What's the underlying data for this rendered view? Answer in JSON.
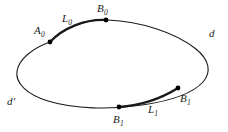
{
  "figure": {
    "type": "geometry-diagram",
    "stroke_color": "#1a1a1a",
    "background_color": "#ffffff",
    "point_color": "#000000"
  },
  "curve": {
    "name": "oval",
    "thin_stroke_width": 1.1,
    "thick_stroke_width": 2.3
  },
  "labels": {
    "a0": {
      "base": "A",
      "sub": "0"
    },
    "b0": {
      "base": "B",
      "sub": "0"
    },
    "l0": {
      "base": "L",
      "sub": "0"
    },
    "b1_bottom": {
      "base": "B",
      "sub": "1"
    },
    "b1_right": {
      "base": "B",
      "sub": "1"
    },
    "l1": {
      "base": "L",
      "sub": "1"
    },
    "d": {
      "base": "d"
    },
    "d_prime": {
      "base": "d",
      "prime": "′"
    }
  },
  "points": [
    {
      "name": "A0",
      "x": 50,
      "y": 42
    },
    {
      "name": "B0",
      "x": 106,
      "y": 20
    },
    {
      "name": "B1-bottom",
      "x": 119,
      "y": 107
    },
    {
      "name": "B1-right",
      "x": 178,
      "y": 88
    }
  ]
}
